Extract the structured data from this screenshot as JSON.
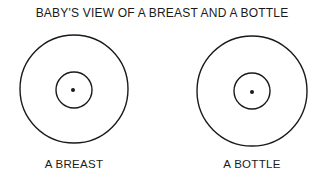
{
  "title": "BABY'S VIEW OF A BREAST AND A BOTTLE",
  "figures": [
    {
      "label": "A BREAST",
      "cx": 74,
      "cy": 89,
      "outer_r": 54,
      "inner_r": 18,
      "dot_r": 2
    },
    {
      "label": "A BOTTLE",
      "cx": 252,
      "cy": 91,
      "outer_r": 55,
      "inner_r": 18,
      "dot_r": 2
    }
  ],
  "colors": {
    "stroke": "#1a1a1a",
    "background": "#ffffff"
  }
}
